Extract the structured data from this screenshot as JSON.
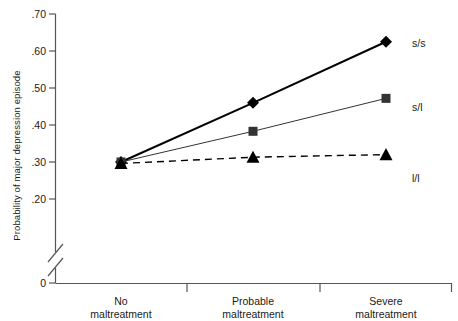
{
  "chart_data": {
    "type": "line",
    "title": "",
    "xlabel": "",
    "ylabel": "Probability of major depression episode",
    "categories": [
      "No maltreatment",
      "Probable maltreatment",
      "Severe maltreatment"
    ],
    "category_lines": [
      [
        "No",
        "maltreatment"
      ],
      [
        "Probable",
        "maltreatment"
      ],
      [
        "Severe",
        "maltreatment"
      ]
    ],
    "ylim": [
      0.2,
      0.7
    ],
    "yticks": [
      ".70",
      ".60",
      ".50",
      ".40",
      ".30",
      ".20"
    ],
    "ytick_values": [
      0.7,
      0.6,
      0.5,
      0.4,
      0.3,
      0.2
    ],
    "zero_tick": "0",
    "axis_break": true,
    "grid": false,
    "legend_position": "right-of-endpoints",
    "series": [
      {
        "name": "s/s",
        "marker": "diamond",
        "linestyle": "solid",
        "linewidth": 2,
        "color": "#000000",
        "values": [
          0.3,
          0.46,
          0.625
        ]
      },
      {
        "name": "s/l",
        "marker": "square",
        "linestyle": "solid",
        "linewidth": 1,
        "color": "#333333",
        "values": [
          0.3,
          0.383,
          0.472
        ]
      },
      {
        "name": "l/l",
        "marker": "triangle",
        "linestyle": "dashed",
        "linewidth": 1.4,
        "color": "#000000",
        "values": [
          0.296,
          0.313,
          0.32
        ]
      }
    ]
  },
  "colors": {
    "axis": "#555555",
    "text": "#1a1a1a",
    "background": "#ffffff"
  }
}
